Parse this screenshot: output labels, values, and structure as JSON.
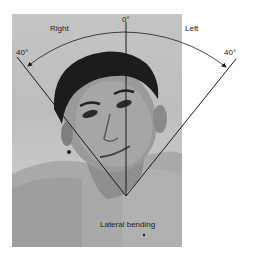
{
  "figure": {
    "labels": {
      "zero": "0°",
      "right": "Right",
      "left": "Left",
      "right_angle": "40°",
      "left_angle": "40°",
      "caption": "Lateral bending"
    },
    "measurement": {
      "movement": "Lateral bending",
      "neutral_deg": 0,
      "right_deg": 40,
      "left_deg": 40
    },
    "colors": {
      "line": "#1a1a1a",
      "photo_bg": "#c2c2c2",
      "page_bg": "#ffffff"
    }
  }
}
